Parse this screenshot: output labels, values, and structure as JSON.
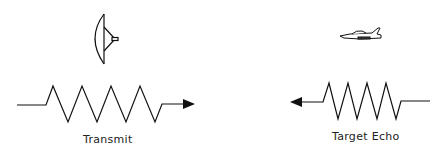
{
  "diagram": {
    "type": "radar-signal-illustration",
    "transmit": {
      "label": "Transmit",
      "icon": "radar-dish-icon",
      "wave_cycles": 4,
      "direction": "right"
    },
    "echo": {
      "label": "Target Echo",
      "icon": "jet-aircraft-icon",
      "wave_cycles": 4,
      "direction": "left"
    },
    "colors": {
      "stroke": "#111111",
      "background": "#ffffff"
    }
  }
}
